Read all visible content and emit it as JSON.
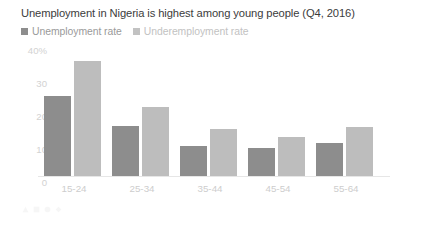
{
  "chart_data": {
    "type": "bar",
    "title": "Unemployment in Nigeria is highest among young people (Q4, 2016)",
    "xlabel": "",
    "ylabel": "",
    "categories": [
      "15-24",
      "25-34",
      "35-44",
      "45-54",
      "55-64"
    ],
    "series": [
      {
        "name": "Unemployment rate",
        "color": "#8d8d8d",
        "values": [
          25.5,
          16,
          9.5,
          9,
          10.5
        ]
      },
      {
        "name": "Underemployment rate",
        "color": "#bdbdbd",
        "values": [
          36.5,
          22,
          15,
          12.5,
          15.5
        ]
      }
    ],
    "ylim": [
      0,
      40
    ],
    "yticks": [
      "40%",
      "30",
      "20",
      "10",
      "0"
    ],
    "ytick_values": [
      40,
      30,
      20,
      10,
      0
    ],
    "grid": false,
    "legend_position": "top-left"
  },
  "legend": [
    {
      "label": "Unemployment rate",
      "color": "#8d8d8d",
      "muted": false
    },
    {
      "label": "Underemployment rate",
      "color": "#c2c2c2",
      "muted": true
    }
  ],
  "footer": {
    "text": ""
  }
}
